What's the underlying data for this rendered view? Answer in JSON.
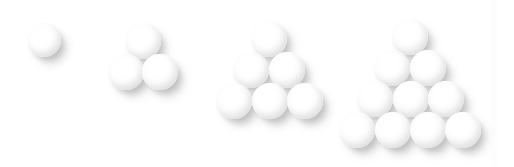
{
  "figure": {
    "caption": "",
    "width": 514,
    "height": 167,
    "background_color": "#ffffff",
    "sphere_color": "#ffffff",
    "sphere_edge_color": "#d2d2d2",
    "shadow_color": "#787878",
    "object_name": "sphere",
    "arrangement": "triangular stack, rows increasing by one from apex to base",
    "light_direction": "upper-left"
  },
  "seam": {
    "name": "paper-seam",
    "x": 489,
    "width": 10,
    "color": "#f2f2f2"
  },
  "chart_data": {
    "type": "scatter",
    "subtitle": "",
    "xlabel": "",
    "ylabel": "",
    "xlim": [
      0,
      514
    ],
    "ylim": [
      167,
      0
    ],
    "grid": false,
    "legend": null,
    "marker": "sphere",
    "categories": [
      "T1",
      "T2",
      "T3",
      "T4"
    ],
    "values": [
      1,
      3,
      6,
      10
    ],
    "series": [
      {
        "name": "T1",
        "label": "1",
        "rows": 1,
        "count": 1,
        "radius": 17,
        "spheres": [
          {
            "cx": 44,
            "cy": 40,
            "r": 17,
            "row": 1,
            "index": 1
          }
        ]
      },
      {
        "name": "T2",
        "label": "3",
        "rows": 2,
        "count": 3,
        "radius": 18,
        "spheres": [
          {
            "cx": 143,
            "cy": 41,
            "r": 18,
            "row": 1,
            "index": 1
          },
          {
            "cx": 126,
            "cy": 72,
            "r": 18,
            "row": 2,
            "index": 1
          },
          {
            "cx": 160,
            "cy": 72,
            "r": 18,
            "row": 2,
            "index": 2
          }
        ]
      },
      {
        "name": "T3",
        "label": "6",
        "rows": 3,
        "count": 6,
        "radius": 18,
        "spheres": [
          {
            "cx": 269,
            "cy": 39,
            "r": 18,
            "row": 1,
            "index": 1
          },
          {
            "cx": 251,
            "cy": 70,
            "r": 18,
            "row": 2,
            "index": 1
          },
          {
            "cx": 287,
            "cy": 70,
            "r": 18,
            "row": 2,
            "index": 2
          },
          {
            "cx": 234,
            "cy": 101,
            "r": 18,
            "row": 3,
            "index": 1
          },
          {
            "cx": 270,
            "cy": 101,
            "r": 18,
            "row": 3,
            "index": 2
          },
          {
            "cx": 305,
            "cy": 101,
            "r": 18,
            "row": 3,
            "index": 3
          }
        ]
      },
      {
        "name": "T4",
        "label": "10",
        "rows": 4,
        "count": 10,
        "radius": 18,
        "spheres": [
          {
            "cx": 410,
            "cy": 37,
            "r": 18,
            "row": 1,
            "index": 1
          },
          {
            "cx": 392,
            "cy": 68,
            "r": 18,
            "row": 2,
            "index": 1
          },
          {
            "cx": 428,
            "cy": 68,
            "r": 18,
            "row": 2,
            "index": 2
          },
          {
            "cx": 375,
            "cy": 99,
            "r": 18,
            "row": 3,
            "index": 1
          },
          {
            "cx": 411,
            "cy": 99,
            "r": 18,
            "row": 3,
            "index": 2
          },
          {
            "cx": 446,
            "cy": 99,
            "r": 18,
            "row": 3,
            "index": 3
          },
          {
            "cx": 357,
            "cy": 130,
            "r": 18,
            "row": 4,
            "index": 1
          },
          {
            "cx": 393,
            "cy": 130,
            "r": 18,
            "row": 4,
            "index": 2
          },
          {
            "cx": 428,
            "cy": 130,
            "r": 18,
            "row": 4,
            "index": 3
          },
          {
            "cx": 463,
            "cy": 130,
            "r": 18,
            "row": 4,
            "index": 4
          }
        ]
      }
    ]
  }
}
